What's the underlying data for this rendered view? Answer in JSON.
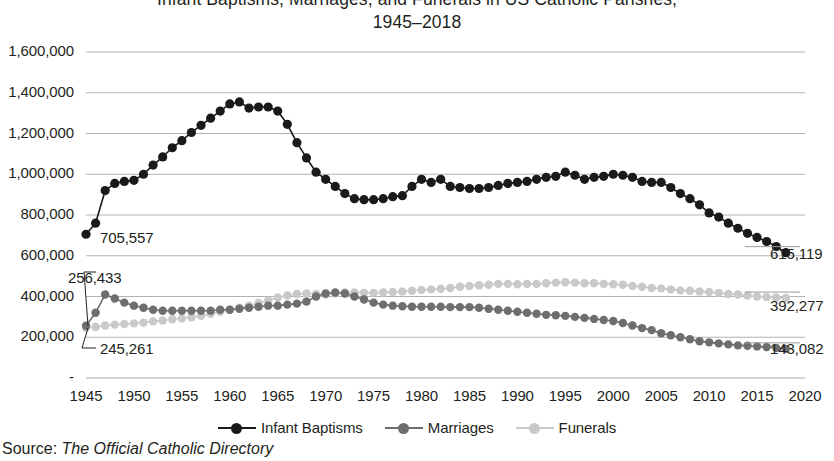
{
  "title": {
    "line1": "Infant Baptisms, Marriages, and Funerals in US Catholic Parishes,",
    "line2": "1945–2018"
  },
  "source": {
    "prefix": "Source: ",
    "publication": "The Official Catholic Directory"
  },
  "legend": {
    "items": [
      {
        "label": "Infant Baptisms",
        "color": "#1a1a1a"
      },
      {
        "label": "Marriages",
        "color": "#6e6e6e"
      },
      {
        "label": "Funerals",
        "color": "#c9c9c9"
      }
    ]
  },
  "annotations": [
    {
      "name": "baptisms-start-label",
      "text": "705,557",
      "x": 100,
      "y": 229
    },
    {
      "name": "marriages-start-label",
      "text": "256,433",
      "x": 68,
      "y": 269
    },
    {
      "name": "funerals-start-label",
      "text": "245,261",
      "x": 100,
      "y": 340
    },
    {
      "name": "baptisms-end-label",
      "text": "615,119",
      "x": 770,
      "y": 245
    },
    {
      "name": "funerals-end-label",
      "text": "392,277",
      "x": 770,
      "y": 297
    },
    {
      "name": "marriages-end-label",
      "text": "143,082",
      "x": 770,
      "y": 340
    }
  ],
  "chart_data": {
    "type": "line",
    "title": "Infant Baptisms, Marriages, and Funerals in US Catholic Parishes, 1945–2018",
    "xlabel": "",
    "ylabel": "",
    "grid": true,
    "legend_position": "bottom",
    "xlim": [
      1945,
      2020
    ],
    "ylim": [
      0,
      1600000
    ],
    "xticks": [
      1945,
      1950,
      1955,
      1960,
      1965,
      1970,
      1975,
      1980,
      1985,
      1990,
      1995,
      2000,
      2005,
      2010,
      2015,
      2020
    ],
    "ytick_labels": [
      "-",
      "200,000",
      "400,000",
      "600,000",
      "800,000",
      "1,000,000",
      "1,200,000",
      "1,400,000",
      "1,600,000"
    ],
    "yticks": [
      0,
      200000,
      400000,
      600000,
      800000,
      1000000,
      1200000,
      1400000,
      1600000
    ],
    "x": [
      1945,
      1946,
      1947,
      1948,
      1949,
      1950,
      1951,
      1952,
      1953,
      1954,
      1955,
      1956,
      1957,
      1958,
      1959,
      1960,
      1961,
      1962,
      1963,
      1964,
      1965,
      1966,
      1967,
      1968,
      1969,
      1970,
      1971,
      1972,
      1973,
      1974,
      1975,
      1976,
      1977,
      1978,
      1979,
      1980,
      1981,
      1982,
      1983,
      1984,
      1985,
      1986,
      1987,
      1988,
      1989,
      1990,
      1991,
      1992,
      1993,
      1994,
      1995,
      1996,
      1997,
      1998,
      1999,
      2000,
      2001,
      2002,
      2003,
      2004,
      2005,
      2006,
      2007,
      2008,
      2009,
      2010,
      2011,
      2012,
      2013,
      2014,
      2015,
      2016,
      2017,
      2018
    ],
    "series": [
      {
        "name": "Infant Baptisms",
        "color": "#1a1a1a",
        "values": [
          705557,
          760000,
          920000,
          955000,
          965000,
          970000,
          1000000,
          1045000,
          1085000,
          1130000,
          1165000,
          1205000,
          1240000,
          1275000,
          1310000,
          1345000,
          1355000,
          1325000,
          1330000,
          1330000,
          1310000,
          1245000,
          1155000,
          1080000,
          1010000,
          975000,
          940000,
          905000,
          880000,
          875000,
          875000,
          880000,
          890000,
          895000,
          940000,
          975000,
          960000,
          975000,
          940000,
          935000,
          930000,
          930000,
          935000,
          945000,
          955000,
          960000,
          965000,
          975000,
          985000,
          990000,
          1010000,
          995000,
          975000,
          985000,
          990000,
          1000000,
          995000,
          985000,
          965000,
          960000,
          960000,
          935000,
          905000,
          880000,
          850000,
          810000,
          790000,
          760000,
          735000,
          710000,
          690000,
          670000,
          645000,
          615119
        ]
      },
      {
        "name": "Marriages",
        "color": "#6e6e6e",
        "values": [
          256433,
          320000,
          410000,
          390000,
          370000,
          355000,
          345000,
          335000,
          330000,
          330000,
          330000,
          330000,
          330000,
          330000,
          335000,
          335000,
          340000,
          345000,
          350000,
          355000,
          355000,
          360000,
          365000,
          375000,
          400000,
          415000,
          420000,
          415000,
          400000,
          385000,
          370000,
          360000,
          355000,
          352000,
          350000,
          350000,
          350000,
          350000,
          348000,
          348000,
          348000,
          345000,
          340000,
          335000,
          330000,
          325000,
          320000,
          315000,
          310000,
          308000,
          305000,
          300000,
          295000,
          290000,
          285000,
          280000,
          270000,
          258000,
          245000,
          235000,
          220000,
          210000,
          200000,
          190000,
          180000,
          175000,
          170000,
          165000,
          160000,
          158000,
          155000,
          152000,
          148000,
          143082
        ]
      },
      {
        "name": "Funerals",
        "color": "#c9c9c9",
        "values": [
          245261,
          250000,
          258000,
          262000,
          265000,
          268000,
          272000,
          278000,
          282000,
          288000,
          292000,
          298000,
          305000,
          315000,
          325000,
          335000,
          345000,
          355000,
          368000,
          380000,
          395000,
          405000,
          412000,
          415000,
          412000,
          410000,
          415000,
          420000,
          420000,
          418000,
          418000,
          420000,
          422000,
          425000,
          428000,
          432000,
          435000,
          438000,
          442000,
          448000,
          452000,
          455000,
          458000,
          462000,
          462000,
          460000,
          462000,
          462000,
          465000,
          468000,
          470000,
          468000,
          465000,
          465000,
          462000,
          460000,
          458000,
          452000,
          448000,
          442000,
          440000,
          435000,
          430000,
          428000,
          425000,
          422000,
          418000,
          412000,
          410000,
          405000,
          400000,
          398000,
          395000,
          392277
        ]
      }
    ]
  }
}
